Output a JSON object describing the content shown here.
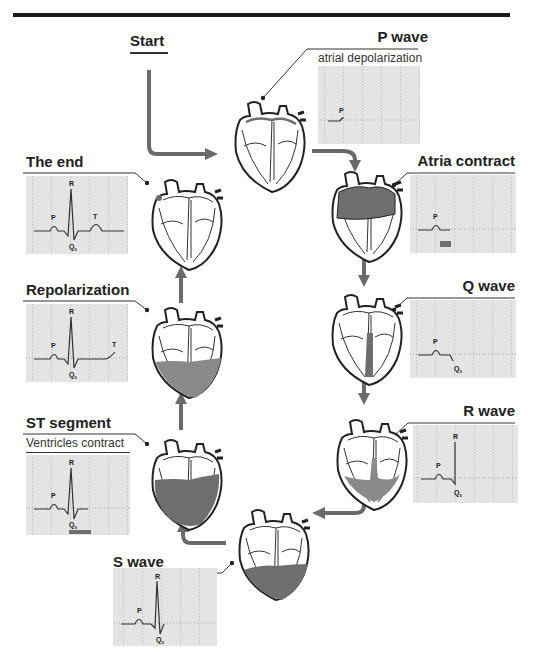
{
  "diagram": {
    "colors": {
      "arrow": "#6a6a6a",
      "ecg_background": "#e4e4e4",
      "grid": "#a8a8a8",
      "trace": "#333333",
      "shade": "#6e6e6e",
      "rule": "#1a1a1a"
    },
    "start": {
      "label": "Start"
    },
    "stages": [
      {
        "id": "p-wave",
        "title": "P wave",
        "subtitle": "atrial depolarization",
        "labels": [
          "P"
        ]
      },
      {
        "id": "atria-contract",
        "title": "Atria contract",
        "labels": [
          "P"
        ]
      },
      {
        "id": "q-wave",
        "title": "Q wave",
        "labels": [
          "P",
          "Q",
          "s"
        ]
      },
      {
        "id": "r-wave",
        "title": "R wave",
        "labels": [
          "R",
          "P",
          "Q",
          "s"
        ]
      },
      {
        "id": "s-wave",
        "title": "S wave",
        "labels": [
          "R",
          "P",
          "Q",
          "s"
        ]
      },
      {
        "id": "st-segment",
        "title": "ST segment",
        "subtitle": "Ventricles contract",
        "labels": [
          "R",
          "P",
          "Q",
          "s"
        ]
      },
      {
        "id": "repolarization",
        "title": "Repolarization",
        "labels": [
          "R",
          "P",
          "T",
          "Q",
          "s"
        ]
      },
      {
        "id": "the-end",
        "title": "The end",
        "labels": [
          "R",
          "P",
          "T",
          "Q",
          "s"
        ]
      }
    ],
    "flow_order": [
      "Start",
      "P wave",
      "Atria contract",
      "Q wave",
      "R wave",
      "S wave",
      "ST segment",
      "Repolarization",
      "The end"
    ]
  }
}
